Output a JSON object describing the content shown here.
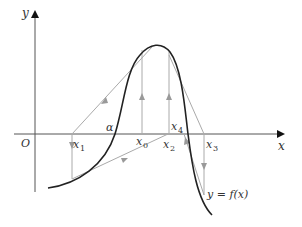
{
  "diagram": {
    "type": "newton-iteration-graph",
    "axes": {
      "x_label": "x",
      "y_label": "y",
      "origin_label": "O"
    },
    "curve_label": "y = f(x)",
    "angle_label": "α",
    "points": [
      {
        "name": "x1",
        "base": "x",
        "sub": "1"
      },
      {
        "name": "x0",
        "base": "x",
        "sub": "0"
      },
      {
        "name": "x2",
        "base": "x",
        "sub": "2"
      },
      {
        "name": "x3",
        "base": "x",
        "sub": "3"
      },
      {
        "name": "x4",
        "base": "x",
        "sub": "4"
      }
    ],
    "colors": {
      "axis": "#555555",
      "curve": "#222222",
      "iteration_lines": "#aaaaaa",
      "text": "#333333"
    }
  }
}
